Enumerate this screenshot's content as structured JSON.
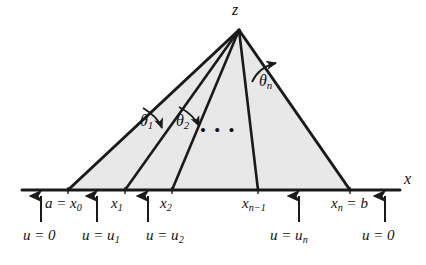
{
  "figure": {
    "title_label": "z",
    "axis_label": "x",
    "colors": {
      "fill": "#e8e8e8",
      "stroke": "#1a1a1a",
      "axis": "#1a1a1a",
      "text": "#111111",
      "background": "#ffffff"
    },
    "apex": {
      "x": 239,
      "y": 30,
      "label": "z"
    },
    "baseline_y": 190,
    "ellipsis": "• • •",
    "angles": [
      {
        "name": "theta-1",
        "label_base": "θ",
        "label_sub": "1"
      },
      {
        "name": "theta-2",
        "label_base": "θ",
        "label_sub": "2"
      },
      {
        "name": "theta-n",
        "label_base": "θ",
        "label_sub": "n"
      }
    ],
    "nodes": [
      {
        "name": "x0",
        "x": 68,
        "label_html": "a = x<sub>0</sub>"
      },
      {
        "name": "x1",
        "x": 125,
        "label_html": "x<sub>1</sub>"
      },
      {
        "name": "x2",
        "x": 172,
        "label_html": "x<sub>2</sub>"
      },
      {
        "name": "xn-1",
        "x": 258,
        "label_html": "x<sub>n−1</sub>"
      },
      {
        "name": "xn",
        "x": 350,
        "label_html": "x<sub>n</sub> = b"
      }
    ],
    "boundary_labels": [
      {
        "name": "u-equals-0-left",
        "arrow_x": 41,
        "label_html": "u = 0"
      },
      {
        "name": "u-equals-u1",
        "arrow_x": 97,
        "label_html": "u = u<sub>1</sub>"
      },
      {
        "name": "u-equals-u2",
        "arrow_x": 148,
        "label_html": "u = u<sub>2</sub>"
      },
      {
        "name": "u-equals-un",
        "arrow_x": 299,
        "label_html": "u = u<sub>n</sub>"
      },
      {
        "name": "u-equals-0-right",
        "arrow_x": 385,
        "label_html": "u = 0"
      }
    ],
    "texts": {
      "z": "z",
      "x": "x",
      "theta1_base": "θ",
      "theta1_sub": "1",
      "theta2_base": "θ",
      "theta2_sub": "2",
      "thetan_base": "θ",
      "thetan_sub": "n",
      "x0": "a = x",
      "x0_sub": "0",
      "x1": "x",
      "x1_sub": "1",
      "x2": "x",
      "x2_sub": "2",
      "xnm1": "x",
      "xnm1_sub": "n−1",
      "xn": "x",
      "xn_sub": "n",
      "xn_tail": " = b",
      "u0_left": "u = 0",
      "uu1": "u = u",
      "uu1_sub": "1",
      "uu2": "u = u",
      "uu2_sub": "2",
      "uun": "u = u",
      "uun_sub": "n",
      "u0_right": "u = 0",
      "ellipsis": "• • •"
    }
  }
}
